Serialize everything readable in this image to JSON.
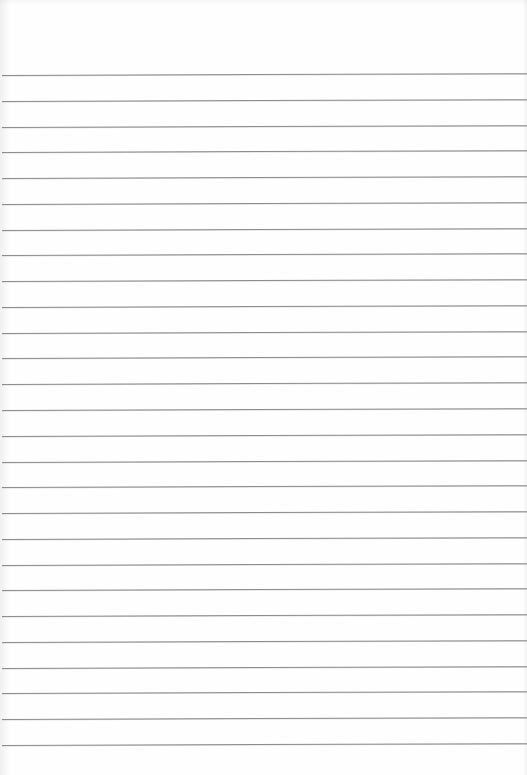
{
  "document": {
    "type": "blank lined paper",
    "line_count": 27,
    "first_line_y": 75,
    "line_spacing_px": 25.77,
    "line_color": "#8c8c8c",
    "background_color": "#fefefe"
  }
}
